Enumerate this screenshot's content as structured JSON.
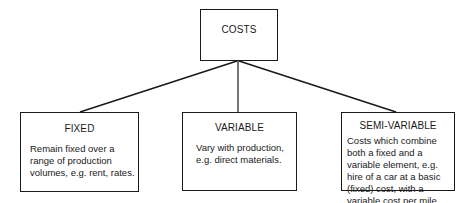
{
  "diagram": {
    "root": {
      "title": "COSTS"
    },
    "children": [
      {
        "title": "FIXED",
        "description": "Remain fixed over a range of production volumes, e.g. rent, rates."
      },
      {
        "title": "VARIABLE",
        "description": "Vary with production, e.g. direct materials."
      },
      {
        "title": "SEMI-VARIABLE",
        "description": "Costs which combine both a fixed and a variable element, e.g. hire of a car at a basic (fixed) cost, with a variable cost per mile."
      }
    ],
    "colors": {
      "line": "#1a1a1a",
      "background": "#ffffff"
    }
  }
}
